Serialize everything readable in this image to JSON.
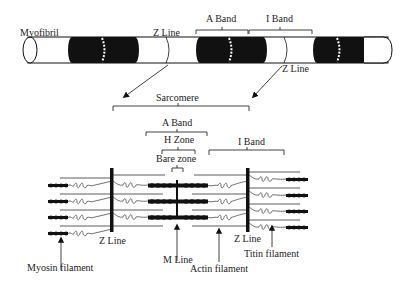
{
  "diagram": {
    "colors": {
      "ink": "#111111",
      "background": "#ffffff",
      "text": "#222222"
    },
    "myofibril": {
      "label": "Myofibril",
      "top_labels": {
        "z_line_left": "Z Line",
        "a_band": "A Band",
        "i_band": "I Band",
        "z_line_right": "Z Line"
      }
    },
    "sarcomere": {
      "label": "Sarcomere",
      "a_band": "A Band",
      "h_zone": "H Zone",
      "bare_zone": "Bare zone",
      "i_band": "I Band"
    },
    "bottom_labels": {
      "myosin_filament": "Myosin filament",
      "z_line_left": "Z Line",
      "m_line": "M Line",
      "actin_filament": "Actin filament",
      "z_line_right": "Z Line",
      "titin_filament": "Titin filament"
    },
    "titin_glyph": "∿∘∘∘∿"
  }
}
